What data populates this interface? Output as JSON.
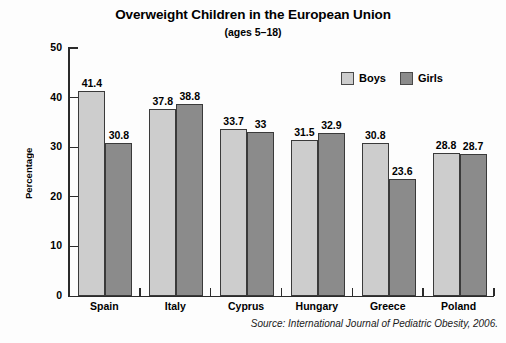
{
  "chart_data": {
    "type": "bar",
    "title": "Overweight Children in the European Union",
    "subtitle": "(ages 5–18)",
    "xlabel": "",
    "ylabel": "Percentage",
    "ylim": [
      0,
      50
    ],
    "ytick_labels": [
      "50",
      "40",
      "30",
      "20",
      "10",
      "0"
    ],
    "yticks": [
      50,
      40,
      30,
      20,
      10,
      0
    ],
    "grid": false,
    "legend_position": "top-right",
    "categories": [
      "Spain",
      "Italy",
      "Cyprus",
      "Hungary",
      "Greece",
      "Poland"
    ],
    "series": [
      {
        "name": "Boys",
        "color": "#cdcdcd",
        "values": [
          41.4,
          37.8,
          33.7,
          31.5,
          30.8,
          28.8
        ],
        "labels": [
          "41.4",
          "37.8",
          "33.7",
          "31.5",
          "30.8",
          "28.8"
        ]
      },
      {
        "name": "Girls",
        "color": "#8b8b8b",
        "values": [
          30.8,
          38.8,
          33,
          32.9,
          23.6,
          28.7
        ],
        "labels": [
          "30.8",
          "38.8",
          "33",
          "32.9",
          "23.6",
          "28.7"
        ]
      }
    ],
    "source_note": "Source: International Journal of Pediatric Obesity, 2006."
  },
  "legend": {
    "entries": [
      {
        "label": "Boys"
      },
      {
        "label": "Girls"
      }
    ]
  }
}
